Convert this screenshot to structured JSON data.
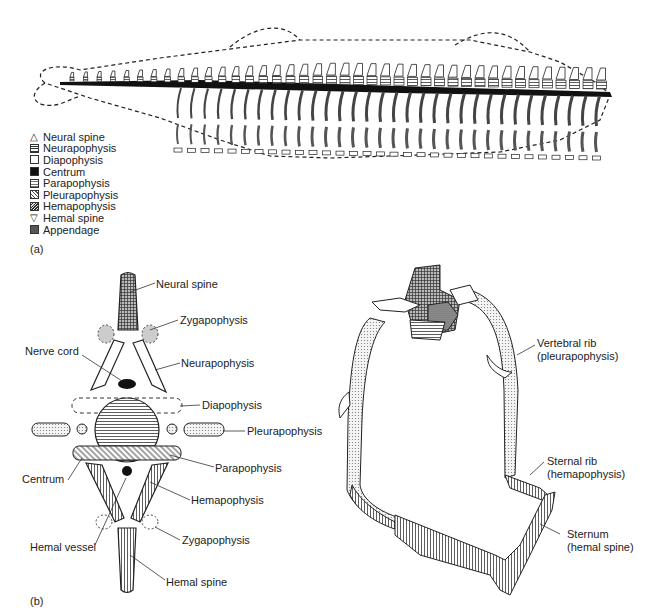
{
  "figure": {
    "panel_a_label": "(a)",
    "panel_b_label": "(b)",
    "legend": [
      {
        "label": "Neural spine",
        "symbol": "open-triangle-up"
      },
      {
        "label": "Neurapophysis",
        "symbol": "horizontal-hatch"
      },
      {
        "label": "Diapophysis",
        "symbol": "open-square"
      },
      {
        "label": "Centrum",
        "symbol": "solid-black"
      },
      {
        "label": "Parapophysis",
        "symbol": "horizontal-hatch-light"
      },
      {
        "label": "Pleurapophysis",
        "symbol": "diagonal-hatch"
      },
      {
        "label": "Hemapophysis",
        "symbol": "diagonal-hatch-dense"
      },
      {
        "label": "Hemal spine",
        "symbol": "open-triangle-down"
      },
      {
        "label": "Appendage",
        "symbol": "crosshatch-dark"
      }
    ],
    "vertebra_labels": {
      "neural_spine": "Neural spine",
      "zygapophysis_top": "Zygapophysis",
      "nerve_cord": "Nerve cord",
      "neurapophysis": "Neurapophysis",
      "diapophysis": "Diapophysis",
      "pleurapophysis": "Pleurapophysis",
      "parapophysis": "Parapophysis",
      "centrum": "Centrum",
      "hemapophysis": "Hemapophysis",
      "hemal_vessel": "Hemal vessel",
      "zygapophysis_bottom": "Zygapophysis",
      "hemal_spine": "Hemal spine"
    },
    "ribcage_labels": {
      "vertebral_rib_1": "Vertebral rib",
      "vertebral_rib_2": "(pleurapophysis)",
      "sternal_rib_1": "Sternal rib",
      "sternal_rib_2": "(hemapophysis)",
      "sternum_1": "Sternum",
      "sternum_2": "(hemal spine)"
    }
  }
}
